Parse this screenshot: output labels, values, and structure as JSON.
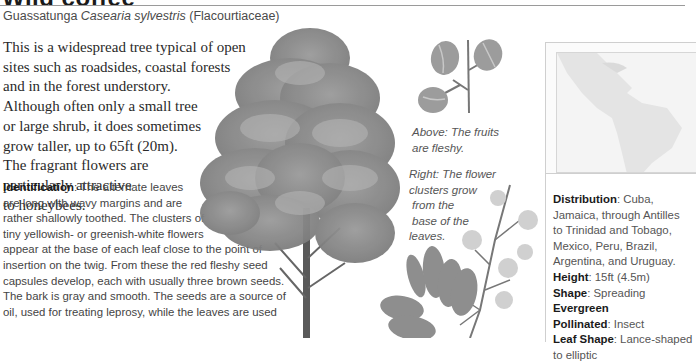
{
  "header": {
    "title": "Wild coffee",
    "common_name": "Guassatunga",
    "scientific_name": "Casearia sylvestris",
    "family": "(Flacourtiaceae)"
  },
  "intro": {
    "lines": [
      "This is a widespread tree typical of open",
      "sites such as roadsides, coastal forests",
      "and in the forest understory.",
      "Although often only a small tree",
      "or large shrub, it does sometimes",
      "grow taller, up to 65ft (20m).",
      "The fragrant flowers are",
      "particularly attractive",
      "to honeybees."
    ]
  },
  "identification": {
    "label": "Identification",
    "lines": [
      ": The alternate leaves",
      "are long with wavy margins and are",
      "rather shallowly toothed. The clusters of",
      "tiny yellowish- or greenish-white flowers",
      "appear at the base of each leaf close to the point of",
      "insertion on the twig. From these the red fleshy seed",
      "capsules develop, each with usually three brown seeds.",
      "The bark is gray and smooth. The seeds are a source of",
      "oil, used for treating leprosy, while the leaves are used"
    ]
  },
  "captions": {
    "fruits": [
      "Above: The fruits",
      "are fleshy."
    ],
    "flowers": [
      "Right: The flower",
      "clusters grow",
      " from the",
      " base of the",
      "leaves."
    ]
  },
  "illustrations": {
    "tree": "tree-illustration",
    "fruits": "fruit-illustration",
    "flowers": "flower-branch-illustration",
    "map": "distribution-map"
  },
  "facts": {
    "distribution_label": "Distribution",
    "distribution_lines": [
      ": Cuba,",
      "Jamaica, through Antilles",
      "to Trinidad and Tobago,",
      "Mexico, Peru, Brazil,",
      "Argentina, and Uruguay."
    ],
    "height_label": "Height",
    "height_value": ": 15ft (4.5m)",
    "shape_label": "Shape",
    "shape_value": ": Spreading",
    "evergreen_label": "Evergreen",
    "pollinated_label": "Pollinated",
    "pollinated_value": ": Insect",
    "leaf_shape_label": "Leaf Shape",
    "leaf_shape_value": ": Lance-shaped",
    "leaf_shape_value_2": "to elliptic"
  },
  "colors": {
    "rule": "#9a9a9a",
    "body_text": "#444444",
    "tree_foliage": "#8a8a8a"
  }
}
